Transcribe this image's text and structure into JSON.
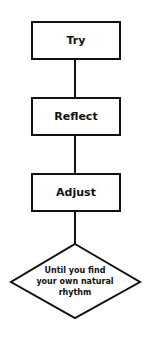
{
  "diagram": {
    "type": "flowchart",
    "nodes": [
      {
        "id": "try",
        "shape": "rectangle",
        "label": "Try"
      },
      {
        "id": "reflect",
        "shape": "rectangle",
        "label": "Reflect"
      },
      {
        "id": "adjust",
        "shape": "rectangle",
        "label": "Adjust"
      },
      {
        "id": "until",
        "shape": "diamond",
        "label": "Until you find your own natural rhythm",
        "lines": [
          "Until you find",
          "your own natural",
          "rhythm"
        ]
      }
    ],
    "edges": [
      {
        "from": "try",
        "to": "reflect"
      },
      {
        "from": "reflect",
        "to": "adjust"
      },
      {
        "from": "adjust",
        "to": "until"
      }
    ],
    "colors": {
      "stroke": "#111111",
      "fill": "#ffffff",
      "text": "#111111"
    }
  }
}
